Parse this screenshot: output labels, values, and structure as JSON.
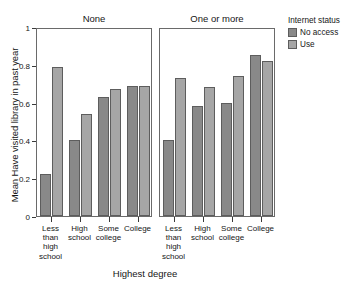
{
  "chart_data": {
    "type": "bar",
    "title": "",
    "xlabel": "Highest degree",
    "ylabel": "Mean Have visited library in past year",
    "ylim": [
      0,
      1
    ],
    "ytick_labels": [
      "0",
      "0.2",
      "0.4",
      "0.6",
      "0.8",
      "1"
    ],
    "ytick_values": [
      0,
      0.2,
      0.4,
      0.6,
      0.8,
      1
    ],
    "grid": false,
    "legend_position": "right",
    "legend_title": "Internet status",
    "facet_variable": "Number of children",
    "panels": [
      {
        "label": "None",
        "categories": [
          "Less than high school",
          "High school",
          "Some college",
          "College"
        ],
        "series": [
          {
            "name": "No access",
            "values": [
              0.22,
              0.4,
              0.63,
              0.69
            ]
          },
          {
            "name": "Use",
            "values": [
              0.79,
              0.54,
              0.67,
              0.69
            ]
          }
        ]
      },
      {
        "label": "One or more",
        "categories": [
          "Less than high school",
          "High school",
          "Some college",
          "College"
        ],
        "series": [
          {
            "name": "No access",
            "values": [
              0.4,
              0.58,
              0.6,
              0.85
            ]
          },
          {
            "name": "Use",
            "values": [
              0.73,
              0.68,
              0.74,
              0.82
            ]
          }
        ]
      }
    ],
    "categories_wrapped": [
      [
        "Less",
        "than",
        "high",
        "school"
      ],
      [
        "High",
        "school"
      ],
      [
        "Some",
        "college"
      ],
      [
        "College"
      ]
    ],
    "series_colors": {
      "No access": "#898989",
      "Use": "#a6a6a6"
    }
  },
  "axis": {
    "y_title": "Mean Have visited library in past year",
    "x_title": "Highest degree",
    "y_ticks": [
      "0",
      "0.2",
      "0.4",
      "0.6",
      "0.8",
      "1"
    ]
  },
  "panel_titles": {
    "left": "None",
    "right": "One or more"
  },
  "legend": {
    "title": "Internet status",
    "items": [
      {
        "label": "No access",
        "color": "#898989"
      },
      {
        "label": "Use",
        "color": "#a6a6a6"
      }
    ]
  },
  "category_labels": {
    "c0": [
      "Less",
      "than",
      "high",
      "school"
    ],
    "c1": [
      "High",
      "school"
    ],
    "c2": [
      "Some",
      "college"
    ],
    "c3": [
      "College"
    ]
  }
}
